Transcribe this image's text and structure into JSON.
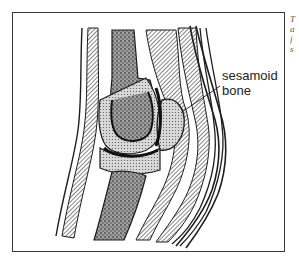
{
  "figure": {
    "labels": [
      {
        "id": "sesamoid-bone",
        "line1": "sesamoid",
        "line2": "bone"
      }
    ],
    "caption_fragments": [
      "T",
      "a",
      "j",
      "s"
    ],
    "colors": {
      "ink": "#1e1e1e",
      "frame": "#3a3a3a",
      "background": "#ffffff"
    }
  }
}
